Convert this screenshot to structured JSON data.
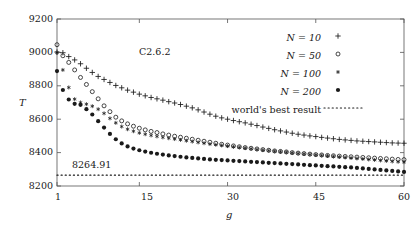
{
  "chart_data": {
    "type": "scatter",
    "title": "C2.6.2",
    "xlabel": "g",
    "ylabel": "T",
    "xlim": [
      1,
      60
    ],
    "ylim": [
      8200,
      9200
    ],
    "grid": false,
    "legend_position": "top-right",
    "xticks": [
      1,
      15,
      30,
      45,
      60
    ],
    "yticks": [
      8200,
      8400,
      8600,
      8800,
      9000,
      9200
    ],
    "xtick_labels": [
      "1",
      "15",
      "30",
      "45",
      "60"
    ],
    "ytick_labels": [
      "8200",
      "8400",
      "8600",
      "8800",
      "9000",
      "9200"
    ],
    "annotations": [
      {
        "text": "C2.6.2",
        "x": 18,
        "y": 9005
      },
      {
        "text": "8264.91",
        "x": 3.5,
        "y": 8310
      }
    ],
    "reference_line": {
      "label": "world's best result",
      "value": 8264.91,
      "style": "dotted"
    },
    "series": [
      {
        "name": "N = 10",
        "marker": "plus",
        "x": [
          1,
          2,
          3,
          4,
          5,
          6,
          7,
          8,
          9,
          10,
          11,
          12,
          13,
          14,
          15,
          16,
          17,
          18,
          19,
          20,
          21,
          22,
          23,
          24,
          25,
          26,
          27,
          28,
          29,
          30,
          31,
          32,
          33,
          34,
          35,
          36,
          37,
          38,
          39,
          40,
          41,
          42,
          43,
          44,
          45,
          46,
          47,
          48,
          49,
          50,
          51,
          52,
          53,
          54,
          55,
          56,
          57,
          58,
          59,
          60
        ],
        "values": [
          9002,
          8998,
          8975,
          8955,
          8932,
          8905,
          8880,
          8856,
          8838,
          8820,
          8802,
          8788,
          8774,
          8762,
          8750,
          8740,
          8730,
          8722,
          8714,
          8705,
          8697,
          8688,
          8678,
          8668,
          8656,
          8643,
          8630,
          8618,
          8608,
          8600,
          8592,
          8585,
          8578,
          8570,
          8562,
          8553,
          8545,
          8537,
          8530,
          8523,
          8516,
          8510,
          8505,
          8500,
          8496,
          8491,
          8487,
          8483,
          8479,
          8476,
          8473,
          8470,
          8468,
          8466,
          8464,
          8462,
          8460,
          8458,
          8457,
          8456
        ]
      },
      {
        "name": "N = 50",
        "marker": "circle",
        "x": [
          1,
          2,
          3,
          4,
          5,
          6,
          7,
          8,
          9,
          10,
          11,
          12,
          13,
          14,
          15,
          16,
          17,
          18,
          19,
          20,
          21,
          22,
          23,
          24,
          25,
          26,
          27,
          28,
          29,
          30,
          31,
          32,
          33,
          34,
          35,
          36,
          37,
          38,
          39,
          40,
          41,
          42,
          43,
          44,
          45,
          46,
          47,
          48,
          49,
          50,
          51,
          52,
          53,
          54,
          55,
          56,
          57,
          58,
          59,
          60
        ],
        "values": [
          9046,
          8980,
          8940,
          8895,
          8850,
          8808,
          8765,
          8722,
          8680,
          8645,
          8612,
          8590,
          8572,
          8558,
          8546,
          8536,
          8527,
          8520,
          8512,
          8505,
          8498,
          8492,
          8486,
          8480,
          8474,
          8468,
          8462,
          8456,
          8450,
          8445,
          8440,
          8435,
          8430,
          8426,
          8422,
          8418,
          8414,
          8410,
          8407,
          8404,
          8400,
          8397,
          8394,
          8391,
          8388,
          8386,
          8383,
          8381,
          8379,
          8377,
          8375,
          8373,
          8371,
          8369,
          8367,
          8365,
          8363,
          8361,
          8359,
          8358
        ]
      },
      {
        "name": "N = 100",
        "marker": "star",
        "x": [
          1,
          2,
          3,
          4,
          5,
          6,
          7,
          8,
          9,
          10,
          11,
          12,
          13,
          14,
          15,
          16,
          17,
          18,
          19,
          20,
          21,
          22,
          23,
          24,
          25,
          26,
          27,
          28,
          29,
          30,
          31,
          32,
          33,
          34,
          35,
          36,
          37,
          38,
          39,
          40,
          41,
          42,
          43,
          44,
          45,
          46,
          47,
          48,
          49,
          50,
          51,
          52,
          53,
          54,
          55,
          56,
          57,
          58,
          59,
          60
        ],
        "values": [
          8998,
          8895,
          8790,
          8720,
          8700,
          8690,
          8678,
          8660,
          8635,
          8605,
          8578,
          8556,
          8540,
          8528,
          8518,
          8510,
          8503,
          8497,
          8491,
          8486,
          8481,
          8476,
          8471,
          8466,
          8461,
          8456,
          8451,
          8447,
          8443,
          8439,
          8435,
          8431,
          8427,
          8423,
          8419,
          8415,
          8412,
          8408,
          8405,
          8402,
          8398,
          8395,
          8392,
          8389,
          8386,
          8383,
          8380,
          8377,
          8374,
          8371,
          8368,
          8365,
          8362,
          8359,
          8356,
          8353,
          8350,
          8347,
          8345,
          8343
        ]
      },
      {
        "name": "N = 200",
        "marker": "filled-circle",
        "x": [
          1,
          2,
          3,
          4,
          5,
          6,
          7,
          8,
          9,
          10,
          11,
          12,
          13,
          14,
          15,
          16,
          17,
          18,
          19,
          20,
          21,
          22,
          23,
          24,
          25,
          26,
          27,
          28,
          29,
          30,
          31,
          32,
          33,
          34,
          35,
          36,
          37,
          38,
          39,
          40,
          41,
          42,
          43,
          44,
          45,
          46,
          47,
          48,
          49,
          50,
          51,
          52,
          53,
          54,
          55,
          56,
          57,
          58,
          59,
          60
        ],
        "values": [
          8888,
          8775,
          8718,
          8692,
          8686,
          8660,
          8628,
          8588,
          8550,
          8512,
          8480,
          8455,
          8437,
          8424,
          8414,
          8406,
          8399,
          8393,
          8388,
          8383,
          8379,
          8375,
          8371,
          8368,
          8365,
          8362,
          8359,
          8357,
          8355,
          8353,
          8351,
          8349,
          8347,
          8345,
          8343,
          8341,
          8339,
          8337,
          8335,
          8333,
          8331,
          8329,
          8327,
          8325,
          8323,
          8321,
          8319,
          8317,
          8315,
          8313,
          8311,
          8308,
          8305,
          8302,
          8299,
          8296,
          8293,
          8290,
          8287,
          8284
        ]
      }
    ]
  },
  "legend": {
    "entries": [
      {
        "label": "N = 10",
        "marker": "plus"
      },
      {
        "label": "N = 50",
        "marker": "circle"
      },
      {
        "label": "N = 100",
        "marker": "star"
      },
      {
        "label": "N = 200",
        "marker": "filled-circle"
      },
      {
        "label": "world's best result",
        "marker": "dotted-line"
      }
    ]
  },
  "colors": {
    "ink": "#1a1a1a",
    "axis": "#555555",
    "background": "#ffffff"
  }
}
